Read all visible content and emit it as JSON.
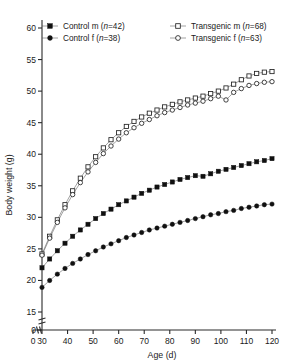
{
  "chart_data": {
    "type": "scatter",
    "title": "",
    "xlabel": "Age (d)",
    "ylabel": "Body weight (g)",
    "xlim": [
      30,
      120
    ],
    "ylim": [
      15,
      60
    ],
    "xticks": [
      0,
      30,
      40,
      50,
      60,
      70,
      80,
      90,
      100,
      110,
      120
    ],
    "yticks": [
      0,
      15,
      20,
      25,
      30,
      35,
      40,
      45,
      50,
      55,
      60
    ],
    "x_axis_break": true,
    "y_axis_break": true,
    "grid": false,
    "legend_position": "top",
    "series": [
      {
        "name": "Control m",
        "n": 42,
        "label": "Control m (n=42)",
        "marker": "filled-square",
        "color": "#101010",
        "x": [
          30,
          33,
          36,
          39,
          42,
          45,
          48,
          51,
          54,
          57,
          60,
          63,
          66,
          69,
          72,
          75,
          78,
          81,
          84,
          87,
          90,
          93,
          96,
          99,
          102,
          105,
          108,
          111,
          114,
          117,
          120
        ],
        "y": [
          22.0,
          23.4,
          24.7,
          25.9,
          27.0,
          28.0,
          28.9,
          29.8,
          30.6,
          31.3,
          32.0,
          32.6,
          33.2,
          33.8,
          34.3,
          34.8,
          35.2,
          35.6,
          36.0,
          36.3,
          36.6,
          36.5,
          36.9,
          37.3,
          37.6,
          37.9,
          38.2,
          38.5,
          38.8,
          39.0,
          39.3
        ]
      },
      {
        "name": "Transgenic m",
        "n": 68,
        "label": "Transgenic m (n=68)",
        "marker": "open-square",
        "color": "#222222",
        "x": [
          30,
          33,
          36,
          39,
          42,
          45,
          48,
          51,
          54,
          57,
          60,
          63,
          66,
          69,
          72,
          75,
          78,
          81,
          84,
          87,
          90,
          93,
          96,
          99,
          102,
          105,
          108,
          111,
          114,
          117,
          120
        ],
        "y": [
          24.2,
          27.0,
          29.6,
          32.0,
          34.2,
          36.2,
          38.0,
          39.6,
          41.0,
          42.3,
          43.4,
          44.4,
          45.2,
          45.9,
          46.5,
          47.0,
          47.5,
          47.9,
          48.3,
          48.6,
          48.9,
          49.2,
          49.6,
          50.0,
          50.5,
          51.1,
          51.8,
          52.4,
          52.8,
          53.0,
          53.1
        ]
      },
      {
        "name": "Control f",
        "n": 38,
        "label": "Control f (n=38)",
        "marker": "filled-circle",
        "color": "#101010",
        "x": [
          30,
          33,
          36,
          39,
          42,
          45,
          48,
          51,
          54,
          57,
          60,
          63,
          66,
          69,
          72,
          75,
          78,
          81,
          84,
          87,
          90,
          93,
          96,
          99,
          102,
          105,
          108,
          111,
          114,
          117,
          120
        ],
        "y": [
          18.9,
          20.0,
          21.0,
          21.9,
          22.7,
          23.4,
          24.1,
          24.7,
          25.3,
          25.8,
          26.3,
          26.8,
          27.2,
          27.6,
          28.0,
          28.3,
          28.6,
          28.9,
          29.2,
          29.5,
          29.8,
          30.1,
          30.4,
          30.6,
          30.9,
          31.1,
          31.4,
          31.6,
          31.8,
          32.0,
          32.1
        ]
      },
      {
        "name": "Transgenic f",
        "n": 63,
        "label": "Transgenic f (n=63)",
        "marker": "open-circle",
        "color": "#222222",
        "x": [
          30,
          33,
          36,
          39,
          42,
          45,
          48,
          51,
          54,
          57,
          60,
          63,
          66,
          69,
          72,
          75,
          78,
          81,
          84,
          87,
          90,
          93,
          96,
          99,
          102,
          105,
          108,
          111,
          114,
          117,
          120
        ],
        "y": [
          24.0,
          26.7,
          29.2,
          31.5,
          33.6,
          35.5,
          37.2,
          38.7,
          40.1,
          41.3,
          42.4,
          43.4,
          44.2,
          44.9,
          45.5,
          46.1,
          46.6,
          47.0,
          47.4,
          47.8,
          48.1,
          48.4,
          48.8,
          49.2,
          48.6,
          49.8,
          50.4,
          50.9,
          51.2,
          51.4,
          51.5
        ]
      }
    ]
  },
  "legend": {
    "entries": [
      {
        "label": "Control m (n=42)",
        "marker": "filled-square"
      },
      {
        "label": "Transgenic m (n=68)",
        "marker": "open-square"
      },
      {
        "label": "Control f (n=38)",
        "marker": "filled-circle"
      },
      {
        "label": "Transgenic f (n=63)",
        "marker": "open-circle"
      }
    ]
  }
}
